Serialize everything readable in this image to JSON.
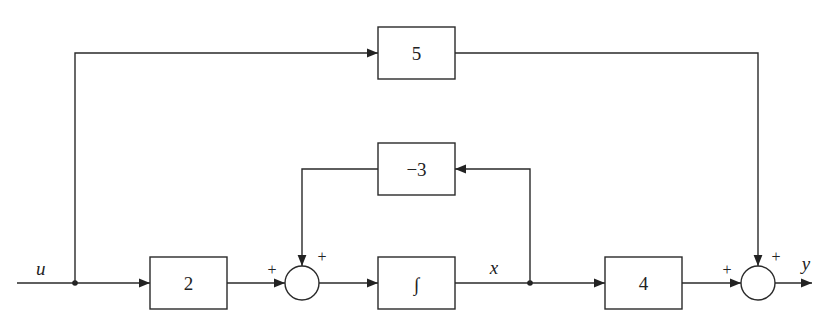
{
  "diagram": {
    "type": "block-diagram",
    "signals": {
      "input": "u",
      "state": "x",
      "output": "y"
    },
    "blocks": [
      {
        "id": "gain_input",
        "label": "2"
      },
      {
        "id": "integrator",
        "label": "∫"
      },
      {
        "id": "feedback_gain",
        "label": "−3"
      },
      {
        "id": "feedforward_gain",
        "label": "5"
      },
      {
        "id": "output_gain",
        "label": "4"
      }
    ],
    "summing_junctions": [
      {
        "id": "sum1",
        "signs": [
          "+",
          "+"
        ]
      },
      {
        "id": "sum2",
        "signs": [
          "+",
          "+"
        ]
      }
    ],
    "connections": [
      {
        "from": "u",
        "to": "gain_input"
      },
      {
        "from": "u",
        "to": "feedforward_gain"
      },
      {
        "from": "gain_input",
        "to": "sum1",
        "sign": "+"
      },
      {
        "from": "feedback_gain",
        "to": "sum1",
        "sign": "+"
      },
      {
        "from": "sum1",
        "to": "integrator"
      },
      {
        "from": "integrator",
        "to": "x"
      },
      {
        "from": "x",
        "to": "feedback_gain"
      },
      {
        "from": "x",
        "to": "output_gain"
      },
      {
        "from": "output_gain",
        "to": "sum2",
        "sign": "+"
      },
      {
        "from": "feedforward_gain",
        "to": "sum2",
        "sign": "+"
      },
      {
        "from": "sum2",
        "to": "y"
      }
    ]
  }
}
